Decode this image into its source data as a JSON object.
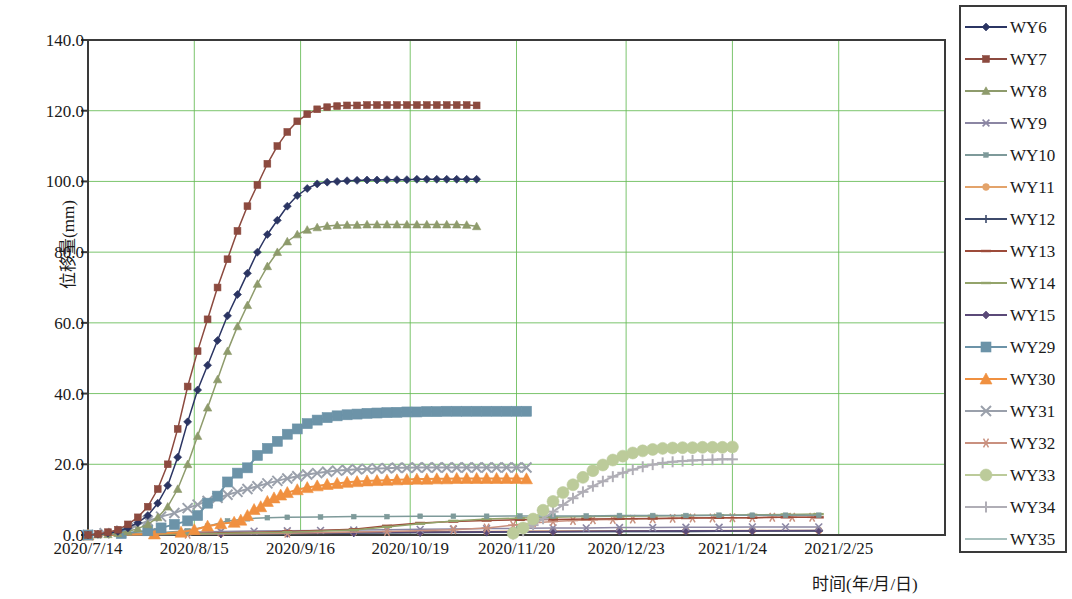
{
  "chart_data": {
    "type": "line",
    "title": "",
    "xlabel": "时间(年/月/日)",
    "ylabel": "位移量(mm)",
    "ylim": [
      0,
      140
    ],
    "ytick_labels": [
      "0.0",
      "20.0",
      "40.0",
      "60.0",
      "80.0",
      "100.0",
      "120.0",
      "140.0"
    ],
    "ytick_values": [
      0,
      20,
      40,
      60,
      80,
      100,
      120,
      140
    ],
    "xtick_labels": [
      "2020/7/14",
      "2020/8/15",
      "2020/9/16",
      "2020/10/19",
      "2020/11/20",
      "2020/12/23",
      "2021/1/24",
      "2021/2/25"
    ],
    "xtick_values": [
      0,
      32,
      64,
      97,
      129,
      162,
      194,
      226
    ],
    "xlim": [
      0,
      258
    ],
    "grid": "both",
    "legend_position": "right-outside",
    "series": [
      {
        "name": "WY6",
        "color": "#2b3563",
        "marker": "diamond",
        "x": [
          0,
          3,
          6,
          9,
          12,
          15,
          18,
          21,
          24,
          27,
          30,
          33,
          36,
          39,
          42,
          45,
          48,
          51,
          54,
          57,
          60,
          63,
          66,
          69,
          72,
          75,
          78,
          81,
          84,
          87,
          90,
          93,
          96,
          99,
          102,
          105,
          108,
          111,
          114,
          117
        ],
        "y": [
          0,
          0.2,
          0.5,
          1,
          2,
          3.5,
          5.5,
          9,
          14,
          22,
          32,
          41,
          48,
          55,
          62,
          68,
          74,
          80,
          85,
          89,
          93,
          96,
          98,
          99.3,
          99.8,
          100,
          100.2,
          100.3,
          100.4,
          100.4,
          100.5,
          100.5,
          100.5,
          100.6,
          100.6,
          100.6,
          100.6,
          100.6,
          100.6,
          100.6
        ]
      },
      {
        "name": "WY7",
        "color": "#8c4a3f",
        "marker": "square",
        "x": [
          0,
          3,
          6,
          9,
          12,
          15,
          18,
          21,
          24,
          27,
          30,
          33,
          36,
          39,
          42,
          45,
          48,
          51,
          54,
          57,
          60,
          63,
          66,
          69,
          72,
          75,
          78,
          81,
          84,
          87,
          90,
          93,
          96,
          99,
          102,
          105,
          108,
          111,
          114,
          117
        ],
        "y": [
          0,
          0.3,
          0.8,
          1.5,
          3,
          5,
          8,
          13,
          20,
          30,
          42,
          52,
          61,
          70,
          78,
          86,
          93,
          99,
          105,
          110,
          114,
          117,
          119,
          120.4,
          121,
          121.3,
          121.5,
          121.5,
          121.6,
          121.6,
          121.6,
          121.6,
          121.6,
          121.6,
          121.6,
          121.6,
          121.6,
          121.6,
          121.6,
          121.5
        ]
      },
      {
        "name": "WY8",
        "color": "#8e9b6c",
        "marker": "triangle",
        "x": [
          0,
          3,
          6,
          9,
          12,
          15,
          18,
          21,
          24,
          27,
          30,
          33,
          36,
          39,
          42,
          45,
          48,
          51,
          54,
          57,
          60,
          63,
          66,
          69,
          72,
          75,
          78,
          81,
          84,
          87,
          90,
          93,
          96,
          99,
          102,
          105,
          108,
          111,
          114,
          117
        ],
        "y": [
          0,
          0.1,
          0.2,
          0.5,
          1,
          1.8,
          3,
          5,
          8,
          13,
          20,
          28,
          36,
          44,
          52,
          59,
          65,
          71,
          76,
          80,
          83,
          85,
          86.3,
          87,
          87.4,
          87.6,
          87.7,
          87.7,
          87.8,
          87.8,
          87.8,
          87.8,
          87.8,
          87.8,
          87.8,
          87.8,
          87.8,
          87.8,
          87.7,
          87.3
        ]
      },
      {
        "name": "WY9",
        "color": "#8b86a3",
        "marker": "x",
        "x": [
          0,
          10,
          20,
          30,
          40,
          50,
          60,
          70,
          80,
          90,
          100,
          110,
          120,
          130,
          140,
          150,
          160,
          170,
          180,
          190,
          200,
          210,
          220
        ],
        "y": [
          0,
          0.3,
          0.6,
          0.8,
          1.0,
          1.1,
          1.2,
          1.3,
          1.4,
          1.5,
          1.6,
          1.7,
          1.8,
          1.9,
          2.0,
          2.0,
          2.1,
          2.1,
          2.2,
          2.2,
          2.3,
          2.3,
          2.3
        ]
      },
      {
        "name": "WY10",
        "color": "#7e9a9a",
        "marker": "square-small",
        "x": [
          0,
          10,
          20,
          30,
          36,
          42,
          48,
          54,
          60,
          70,
          80,
          90,
          100,
          110,
          120,
          130,
          140,
          150,
          160,
          170,
          180,
          190,
          200,
          210,
          220
        ],
        "y": [
          0,
          0.2,
          0.6,
          1.2,
          2.5,
          4.0,
          4.6,
          4.9,
          5.0,
          5.1,
          5.2,
          5.2,
          5.3,
          5.3,
          5.3,
          5.4,
          5.4,
          5.4,
          5.5,
          5.5,
          5.5,
          5.6,
          5.6,
          5.6,
          5.6
        ]
      },
      {
        "name": "WY11",
        "color": "#e3a36b",
        "marker": "circle",
        "x": [
          0,
          20,
          40,
          60,
          80,
          100,
          120,
          140,
          160,
          180,
          200,
          220
        ],
        "y": [
          0,
          0.2,
          0.4,
          0.6,
          0.8,
          0.9,
          1.0,
          1.1,
          1.2,
          1.2,
          1.3,
          1.3
        ]
      },
      {
        "name": "WY12",
        "color": "#3d4a6b",
        "marker": "plus",
        "x": [
          0,
          20,
          40,
          60,
          80,
          100,
          120,
          140,
          160,
          180,
          200,
          220
        ],
        "y": [
          0,
          0.1,
          0.3,
          0.5,
          0.6,
          0.7,
          0.8,
          0.9,
          1.0,
          1.0,
          1.1,
          1.1
        ]
      },
      {
        "name": "WY13",
        "color": "#9d4b3a",
        "marker": "dash",
        "x": [
          0,
          30,
          60,
          80,
          90,
          100,
          110,
          120,
          130,
          140,
          150,
          160,
          170,
          180,
          190,
          200,
          210,
          220
        ],
        "y": [
          0,
          0.4,
          1.0,
          1.6,
          2.6,
          3.4,
          3.8,
          4.1,
          4.3,
          4.4,
          4.5,
          4.6,
          4.7,
          4.8,
          4.9,
          4.9,
          5.0,
          5.0
        ]
      },
      {
        "name": "WY14",
        "color": "#93a36a",
        "marker": "dash",
        "x": [
          0,
          30,
          60,
          80,
          90,
          100,
          110,
          120,
          130,
          140,
          150,
          160,
          170,
          180,
          190,
          200,
          210,
          220
        ],
        "y": [
          0,
          0.3,
          0.8,
          1.4,
          2.3,
          3.2,
          4.0,
          4.5,
          4.8,
          5.0,
          5.2,
          5.3,
          5.4,
          5.5,
          5.6,
          5.7,
          5.8,
          5.9
        ]
      },
      {
        "name": "WY15",
        "color": "#5b4a78",
        "marker": "diamond",
        "x": [
          0,
          20,
          40,
          60,
          80,
          100,
          120,
          140,
          160,
          180,
          200,
          220
        ],
        "y": [
          0,
          0.2,
          0.4,
          0.5,
          0.7,
          0.8,
          0.9,
          1.0,
          1.1,
          1.2,
          1.2,
          1.3
        ]
      },
      {
        "name": "WY29",
        "color": "#6c93a8",
        "marker": "square-big",
        "x": [
          0,
          10,
          18,
          22,
          26,
          30,
          33,
          36,
          39,
          42,
          45,
          48,
          51,
          54,
          57,
          60,
          63,
          66,
          69,
          72,
          75,
          78,
          81,
          84,
          87,
          90,
          93,
          96,
          99,
          102,
          105,
          108,
          111,
          114,
          117,
          120,
          123,
          126,
          129,
          132
        ],
        "y": [
          0,
          0.4,
          1.2,
          2.0,
          3.0,
          4.0,
          5.5,
          9.0,
          11.0,
          15.0,
          17.5,
          19.0,
          22.5,
          24.5,
          26.5,
          28.5,
          30.0,
          31.5,
          32.5,
          33.2,
          33.7,
          34.0,
          34.2,
          34.4,
          34.5,
          34.6,
          34.7,
          34.8,
          34.8,
          34.9,
          34.9,
          35.0,
          35.0,
          35.0,
          35.0,
          35.0,
          35.0,
          35.0,
          35.0,
          35.0
        ]
      },
      {
        "name": "WY30",
        "color": "#f09040",
        "marker": "triangle-big",
        "x": [
          0,
          20,
          28,
          32,
          36,
          40,
          44,
          46,
          48,
          50,
          52,
          54,
          56,
          58,
          60,
          63,
          66,
          69,
          72,
          75,
          78,
          81,
          84,
          87,
          90,
          93,
          96,
          99,
          102,
          105,
          108,
          111,
          114,
          117,
          120,
          123,
          126,
          129,
          132
        ],
        "y": [
          0,
          0.3,
          0.8,
          1.5,
          2.5,
          3.2,
          3.6,
          4.2,
          5.5,
          7.2,
          8.0,
          9.5,
          10.5,
          11.3,
          12.0,
          12.8,
          13.4,
          13.9,
          14.3,
          14.6,
          14.9,
          15.1,
          15.3,
          15.4,
          15.5,
          15.6,
          15.7,
          15.8,
          15.8,
          15.9,
          15.9,
          16.0,
          16.0,
          16.0,
          16.0,
          16.0,
          16.0,
          16.0,
          15.9
        ]
      },
      {
        "name": "WY31",
        "color": "#9aa0ab",
        "marker": "x-big",
        "x": [
          0,
          5,
          10,
          14,
          18,
          22,
          26,
          30,
          33,
          36,
          39,
          42,
          45,
          48,
          51,
          54,
          57,
          60,
          63,
          66,
          69,
          72,
          75,
          78,
          81,
          84,
          87,
          90,
          93,
          96,
          99,
          102,
          105,
          108,
          111,
          114,
          117,
          120,
          123,
          126,
          129,
          132
        ],
        "y": [
          0,
          0.5,
          1.2,
          2.5,
          4.0,
          5.2,
          6.2,
          7.6,
          8.6,
          9.6,
          10.5,
          11.4,
          12.2,
          13.0,
          13.8,
          14.6,
          15.3,
          16.0,
          16.6,
          17.1,
          17.5,
          17.9,
          18.2,
          18.4,
          18.6,
          18.7,
          18.8,
          18.9,
          19.0,
          19.0,
          19.1,
          19.1,
          19.1,
          19.1,
          19.1,
          19.1,
          19.1,
          19.1,
          19.1,
          19.1,
          19.1,
          19.1
        ]
      },
      {
        "name": "WY32",
        "color": "#c9907f",
        "marker": "star",
        "x": [
          0,
          30,
          60,
          90,
          110,
          120,
          128,
          134,
          140,
          146,
          152,
          158,
          164,
          170,
          176,
          182,
          188,
          194,
          200,
          206,
          212,
          218
        ],
        "y": [
          0,
          0.2,
          0.5,
          1.0,
          1.5,
          2.0,
          2.8,
          3.4,
          3.8,
          4.1,
          4.3,
          4.4,
          4.5,
          4.6,
          4.7,
          4.8,
          4.8,
          4.9,
          4.9,
          5.0,
          5.0,
          5.0
        ]
      },
      {
        "name": "WY33",
        "color": "#bccb9a",
        "marker": "circle-big",
        "x": [
          128,
          131,
          134,
          137,
          140,
          143,
          146,
          149,
          152,
          155,
          158,
          161,
          164,
          167,
          170,
          173,
          176,
          179,
          182,
          185,
          188,
          191,
          194
        ],
        "y": [
          0.5,
          2.0,
          4.5,
          7.0,
          9.5,
          12.0,
          14.2,
          16.3,
          18.2,
          19.8,
          21.2,
          22.3,
          23.2,
          23.8,
          24.2,
          24.5,
          24.6,
          24.7,
          24.7,
          24.8,
          24.8,
          24.8,
          24.9
        ]
      },
      {
        "name": "WY34",
        "color": "#b0aeb6",
        "marker": "plus-big",
        "x": [
          128,
          131,
          134,
          137,
          140,
          143,
          146,
          149,
          152,
          155,
          158,
          161,
          164,
          167,
          170,
          173,
          176,
          179,
          182,
          185,
          188,
          191,
          194
        ],
        "y": [
          0.3,
          1.2,
          2.8,
          4.6,
          6.6,
          8.5,
          10.4,
          12.2,
          13.8,
          15.2,
          16.5,
          17.6,
          18.5,
          19.3,
          19.9,
          20.4,
          20.7,
          20.9,
          21.1,
          21.2,
          21.3,
          21.4,
          21.4
        ]
      },
      {
        "name": "WY35",
        "color": "#a8c0bd",
        "marker": "line",
        "x": [
          0,
          30,
          60,
          90,
          120,
          150,
          180,
          210,
          220
        ],
        "y": [
          0,
          0.2,
          0.4,
          0.6,
          0.8,
          0.9,
          1.0,
          1.1,
          1.1
        ]
      }
    ]
  },
  "legend": {
    "items": [
      {
        "label": "WY6"
      },
      {
        "label": "WY7"
      },
      {
        "label": "WY8"
      },
      {
        "label": "WY9"
      },
      {
        "label": "WY10"
      },
      {
        "label": "WY11"
      },
      {
        "label": "WY12"
      },
      {
        "label": "WY13"
      },
      {
        "label": "WY14"
      },
      {
        "label": "WY15"
      },
      {
        "label": "WY29"
      },
      {
        "label": "WY30"
      },
      {
        "label": "WY31"
      },
      {
        "label": "WY32"
      },
      {
        "label": "WY33"
      },
      {
        "label": "WY34"
      },
      {
        "label": "WY35"
      }
    ]
  },
  "colors": {
    "grid": "#66bb55",
    "frame": "#3a3a3a",
    "background": "#ffffff"
  }
}
